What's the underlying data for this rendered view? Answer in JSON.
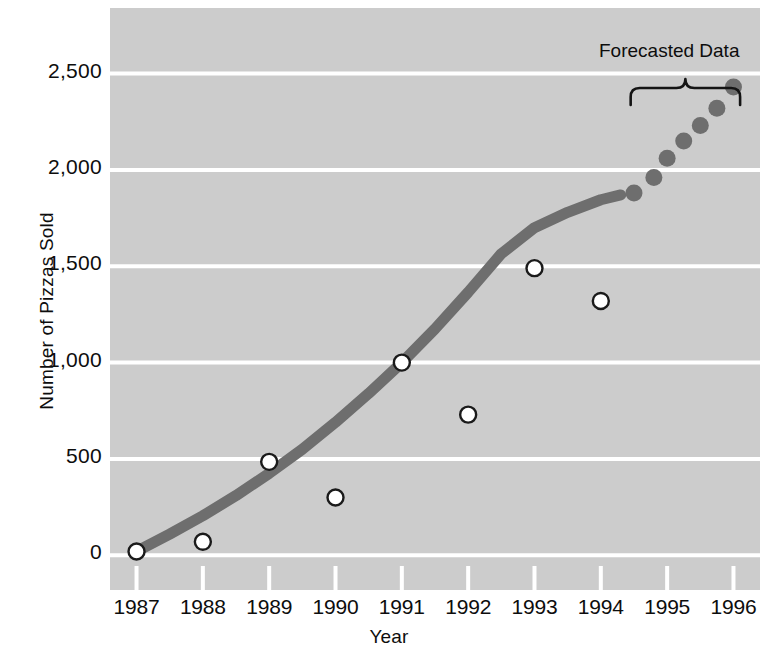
{
  "chart_data": {
    "type": "scatter",
    "title": "",
    "xlabel": "Year",
    "ylabel": "Number of Pizzas Sold",
    "xlim": [
      1986.6,
      1996.4
    ],
    "ylim": [
      -180,
      2840
    ],
    "categories": [
      1987,
      1988,
      1989,
      1990,
      1991,
      1992,
      1993,
      1994
    ],
    "ytick_labels": [
      "0",
      "500",
      "1,000",
      "1,500",
      "2,000",
      "2,500"
    ],
    "ytick_values": [
      0,
      500,
      1000,
      1500,
      2000,
      2500
    ],
    "xtick_labels": [
      "1987",
      "1988",
      "1989",
      "1990",
      "1991",
      "1992",
      "1993",
      "1994",
      "1995",
      "1996"
    ],
    "xtick_values": [
      1987,
      1988,
      1989,
      1990,
      1991,
      1992,
      1993,
      1994,
      1995,
      1996
    ],
    "grid": "horizontal",
    "legend": "none",
    "series": [
      {
        "name": "Observed pizzas sold",
        "marker": "open-circle",
        "marker_fill": "#ffffff",
        "marker_edge": "#1a1a1a",
        "x": [
          1987,
          1988,
          1989,
          1990,
          1991,
          1992,
          1993,
          1994
        ],
        "values": [
          20,
          70,
          485,
          300,
          1000,
          730,
          1490,
          1320
        ]
      },
      {
        "name": "Fitted trend curve",
        "marker": "none",
        "line_color": "#6e6e6e",
        "x": [
          1987.0,
          1987.5,
          1988.0,
          1988.5,
          1989.0,
          1989.5,
          1990.0,
          1990.5,
          1991.0,
          1991.5,
          1992.0,
          1992.5,
          1993.0,
          1993.5,
          1994.0,
          1994.3
        ],
        "values": [
          20,
          110,
          205,
          310,
          425,
          550,
          690,
          840,
          1000,
          1175,
          1365,
          1565,
          1700,
          1780,
          1845,
          1870
        ]
      },
      {
        "name": "Forecasted Data",
        "marker": "filled-circle",
        "marker_fill": "#6e6e6e",
        "x": [
          1994.5,
          1994.8,
          1995.0,
          1995.25,
          1995.5,
          1995.75,
          1996.0
        ],
        "values": [
          1880,
          1960,
          2060,
          2150,
          2230,
          2320,
          2430
        ]
      }
    ],
    "annotations": [
      {
        "text": "Forecasted Data",
        "type": "brace-label",
        "x_start": 1994.45,
        "x_end": 1996.1,
        "y": 2600
      }
    ],
    "colors": {
      "plot_background": "#cccccc",
      "gridline": "#ffffff",
      "curve": "#6e6e6e",
      "forecast_dot": "#6e6e6e",
      "marker_edge": "#1a1a1a",
      "marker_fill": "#ffffff",
      "text": "#0d0d0d",
      "page_background": "#ffffff"
    }
  }
}
